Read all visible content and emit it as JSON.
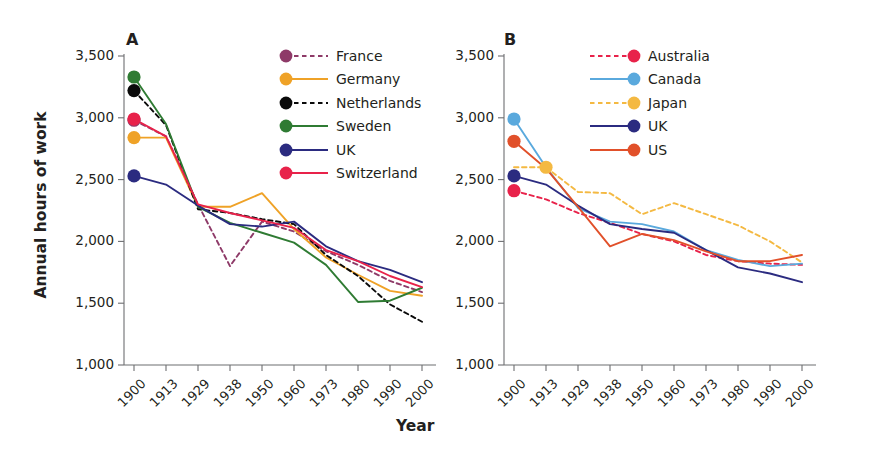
{
  "figure": {
    "ylabel": "Annual hours of work",
    "xlabel": "Year"
  },
  "chart_data": {
    "type": "line",
    "title": "",
    "xlabel": "Year",
    "ylabel": "Annual hours of work",
    "ylim": [
      1000,
      3500
    ],
    "yticks": [
      "1,000",
      "1,500",
      "2,000",
      "2,500",
      "3,000",
      "3,500"
    ],
    "ytick_values": [
      1000,
      1500,
      2000,
      2500,
      3000,
      3500
    ],
    "grid": false,
    "x": [
      "1900",
      "1913",
      "1929",
      "1938",
      "1950",
      "1960",
      "1973",
      "1980",
      "1990",
      "2000"
    ],
    "panels": [
      {
        "letter": "A",
        "legend_position": "top-right",
        "series": [
          {
            "name": "France",
            "color": "#8e3a68",
            "style": "dashed",
            "marker": true,
            "marker_index": 0,
            "values": [
              2980,
              2850,
              2300,
              1800,
              2160,
              2080,
              1920,
              1810,
              1680,
              1590
            ]
          },
          {
            "name": "Germany",
            "color": "#efa227",
            "style": "solid",
            "marker": true,
            "marker_index": 0,
            "values": [
              2840,
              2840,
              2280,
              2280,
              2390,
              2100,
              1870,
              1730,
              1600,
              1560
            ]
          },
          {
            "name": "Netherlands",
            "color": "#0a0a0a",
            "style": "dashed",
            "marker": true,
            "marker_index": 0,
            "values": [
              3220,
              2940,
              2260,
              2230,
              2180,
              2140,
              1890,
              1720,
              1490,
              1350
            ]
          },
          {
            "name": "Sweden",
            "color": "#2f7b33",
            "style": "solid",
            "marker": true,
            "marker_index": 0,
            "values": [
              3330,
              2950,
              2280,
              2150,
              2070,
              1990,
              1810,
              1510,
              1520,
              1625
            ]
          },
          {
            "name": "UK",
            "color": "#2b2b80",
            "style": "solid",
            "marker": true,
            "marker_index": 0,
            "values": [
              2530,
              2460,
              2290,
              2140,
              2120,
              2160,
              1960,
              1840,
              1770,
              1670
            ]
          },
          {
            "name": "Switzerland",
            "color": "#e8224a",
            "style": "solid",
            "marker": true,
            "marker_index": 0,
            "values": [
              2990,
              2850,
              2300,
              2230,
              2170,
              2110,
              1930,
              1840,
              1720,
              1630
            ]
          }
        ]
      },
      {
        "letter": "B",
        "legend_position": "top-right",
        "series": [
          {
            "name": "Australia",
            "color": "#e8224a",
            "style": "dashed",
            "marker": true,
            "marker_index": 0,
            "values": [
              2410,
              2340,
              2230,
              2150,
              2060,
              2000,
              1890,
              1840,
              1820,
              1810
            ]
          },
          {
            "name": "Canada",
            "color": "#5aa9dd",
            "style": "solid",
            "marker": true,
            "marker_index": 0,
            "values": [
              2990,
              2600,
              2270,
              2160,
              2140,
              2080,
              1930,
              1850,
              1800,
              1820
            ]
          },
          {
            "name": "Japan",
            "color": "#f4b942",
            "style": "dashed",
            "marker": true,
            "marker_index": 1,
            "values": [
              2600,
              2600,
              2400,
              2390,
              2220,
              2310,
              2220,
              2130,
              2000,
              1830
            ]
          },
          {
            "name": "UK",
            "color": "#2b2b80",
            "style": "solid",
            "marker": true,
            "marker_index": 0,
            "values": [
              2530,
              2460,
              2290,
              2140,
              2100,
              2070,
              1930,
              1790,
              1740,
              1670
            ]
          },
          {
            "name": "US",
            "color": "#e1502a",
            "style": "solid",
            "marker": true,
            "marker_index": 0,
            "values": [
              2810,
              2590,
              2280,
              1960,
              2060,
              2010,
              1920,
              1840,
              1840,
              1890
            ]
          }
        ]
      }
    ]
  }
}
